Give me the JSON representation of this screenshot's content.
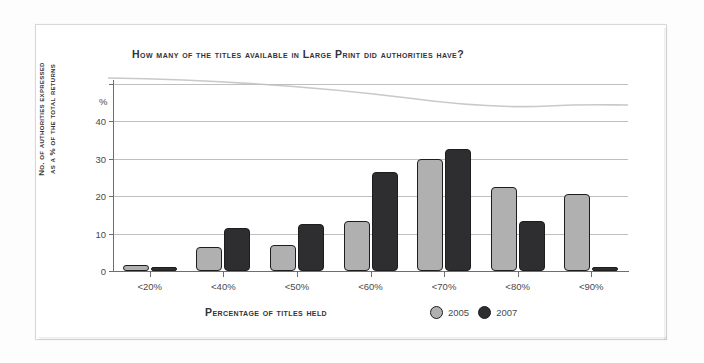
{
  "chart_data": {
    "type": "bar",
    "title": "How many of the titles available in Large Print did authorities have?",
    "xlabel": "Percentage of titles held",
    "ylabel": "No. of authorities expressed as a % of the total returns",
    "ylabel_line1": "No. of authorities expressed",
    "ylabel_line2": "as a % of the total returns",
    "y_unit_symbol": "%",
    "categories": [
      "<20%",
      "<40%",
      "<50%",
      "<60%",
      "<70%",
      "<80%",
      "<90%"
    ],
    "series": [
      {
        "name": "2005",
        "color": "#b0b0b0",
        "values": [
          1.5,
          6.5,
          7,
          13.5,
          30,
          22.5,
          20.5
        ]
      },
      {
        "name": "2007",
        "color": "#2e2e30",
        "values": [
          0.7,
          11.5,
          12.5,
          26.5,
          32.5,
          13.5,
          0.8
        ]
      }
    ],
    "ylim": [
      0,
      50
    ],
    "yticks": [
      0,
      10,
      20,
      30,
      40,
      50
    ],
    "ytick_labels": [
      "0",
      "10",
      "20",
      "30",
      "40",
      ""
    ],
    "grid": true,
    "legend_position": "bottom-right"
  }
}
